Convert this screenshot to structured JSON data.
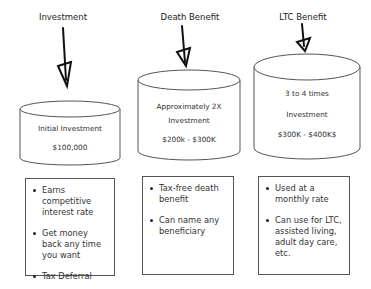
{
  "columns": [
    {
      "heading": "Investment",
      "cylinder": {
        "line1": "Initial Investment",
        "line2": "",
        "amount": "$100,000"
      },
      "bullets": [
        "Earns competitive interest rate",
        "Get money back any time you want",
        "Tax Deferral"
      ]
    },
    {
      "heading": "Death Benefit",
      "cylinder": {
        "line1": "Approximately 2X",
        "line2": "Investment",
        "amount": "$200k - $300K"
      },
      "bullets": [
        "Tax-free death benefit",
        "Can name any beneficiary"
      ]
    },
    {
      "heading": "LTC Benefit",
      "cylinder": {
        "line1": "3 to 4 times",
        "line2": "Investment",
        "amount": "$300K - $400K$"
      },
      "bullets": [
        "Used at a monthly rate",
        "Can use for LTC, assisted living, adult day care, etc."
      ]
    }
  ]
}
